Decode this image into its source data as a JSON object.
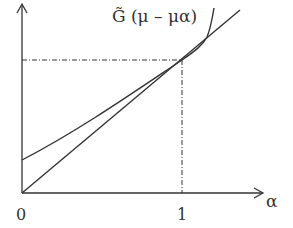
{
  "diagram": {
    "curve_label": "G̃ (μ – μα)",
    "x_axis_label": "α",
    "tick_origin": "0",
    "tick_one": "1",
    "colors": {
      "ink": "#333333",
      "background": "#ffffff"
    },
    "elements": [
      "y-axis arrow",
      "x-axis arrow",
      "straight line through origin",
      "curve G~(mu - mu alpha) starting at positive intercept, tangent-crossing at alpha=1",
      "dash-dot guide lines at alpha=1"
    ]
  }
}
